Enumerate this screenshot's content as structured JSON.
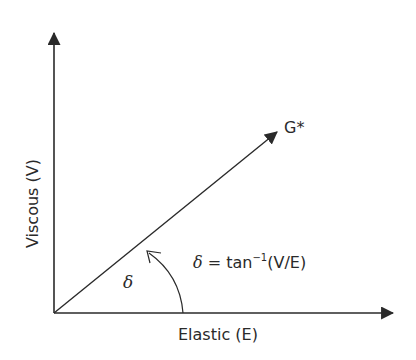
{
  "diagram": {
    "type": "phase-angle vector diagram",
    "x_axis_label": "Elastic (E)",
    "y_axis_label": "Viscous (V)",
    "vector_label": "G*",
    "angle_symbol": "δ",
    "formula": {
      "lhs": "δ",
      "eq": " = tan",
      "sup": "−1",
      "rhs": "(V/E)"
    },
    "colors": {
      "line": "#2a2a2a",
      "background": "#ffffff"
    }
  }
}
